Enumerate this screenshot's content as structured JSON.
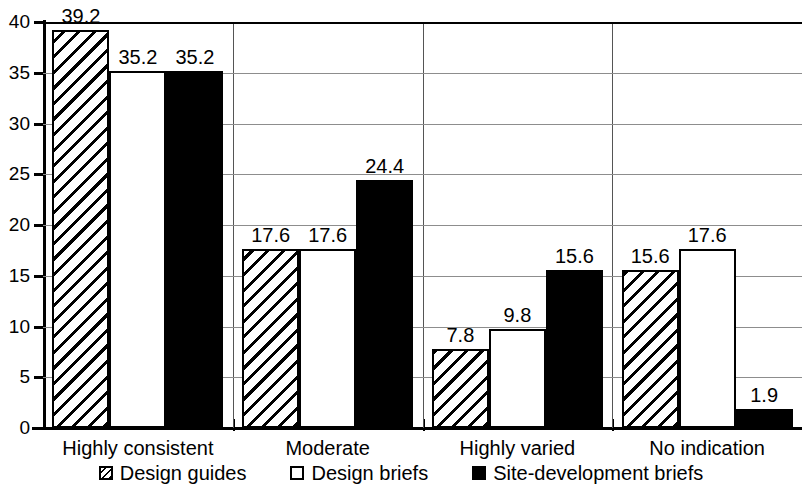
{
  "chart_data": {
    "type": "bar",
    "title": "",
    "subtitle": "",
    "xlabel": "",
    "ylabel": "",
    "ylim": [
      0,
      40
    ],
    "ytick_labels": [
      "40",
      "35",
      "30",
      "25",
      "20",
      "15",
      "10",
      "5",
      "0"
    ],
    "ytick_values": [
      40,
      35,
      30,
      25,
      20,
      15,
      10,
      5,
      0
    ],
    "grid": true,
    "legend_position": "bottom",
    "categories": [
      "Highly consistent",
      "Moderate",
      "Highly varied",
      "No indication"
    ],
    "series": [
      {
        "name": "Design guides",
        "fill": "hatched",
        "values": [
          39.2,
          17.6,
          7.8,
          15.6
        ],
        "labels": [
          "39.2",
          "17.6",
          "7.8",
          "15.6"
        ]
      },
      {
        "name": "Design briefs",
        "fill": "white",
        "values": [
          35.2,
          17.6,
          9.8,
          17.6
        ],
        "labels": [
          "35.2",
          "17.6",
          "9.8",
          "17.6"
        ]
      },
      {
        "name": "Site-development briefs",
        "fill": "black",
        "values": [
          35.2,
          24.4,
          15.6,
          1.9
        ],
        "labels": [
          "35.2",
          "24.4",
          "15.6",
          "1.9"
        ]
      }
    ],
    "colors": {
      "axis": "#000000",
      "grid": "#8d8d8d",
      "series_guides": "#ffffff",
      "series_briefs": "#ffffff",
      "series_site": "#000000",
      "background": "#ffffff"
    }
  }
}
